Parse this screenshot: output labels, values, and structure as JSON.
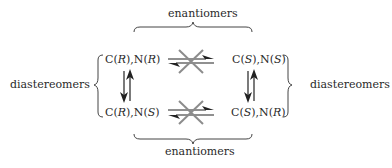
{
  "labels": {
    "top": "enantiomers",
    "bottom": "enantiomers",
    "left": "diastereomers",
    "right": "diastereomers"
  },
  "compounds": {
    "top_left": {
      "c": "R",
      "n": "R"
    },
    "top_right": {
      "c": "S",
      "n": "S"
    },
    "bottom_left": {
      "c": "R",
      "n": "S"
    },
    "bottom_right": {
      "c": "S",
      "n": "R"
    }
  },
  "arrows": {
    "horizontal_top": "equilibrium-crossed-out",
    "horizontal_bottom": "equilibrium-crossed-out",
    "vertical_left": "equilibrium",
    "vertical_right": "equilibrium"
  },
  "colors": {
    "text": "#2a2a2a",
    "arrow": "#222222",
    "cross": "#8c8c8c"
  }
}
